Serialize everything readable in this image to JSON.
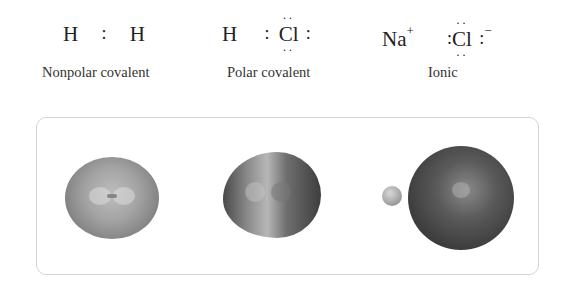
{
  "diagram": {
    "bond_types": [
      {
        "label": "Nonpolar covalent",
        "formula": {
          "left_atom": "H",
          "bond_symbol": ":",
          "right_atom": "H"
        },
        "model": "symmetric-electron-cloud-H2"
      },
      {
        "label": "Polar covalent",
        "formula": {
          "left_atom": "H",
          "bond_symbol": ":",
          "right_atom": "Cl",
          "right_lone_pair_symbol": ":"
        },
        "model": "asymmetric-electron-cloud-HCl"
      },
      {
        "label": "Ionic",
        "formula": {
          "cation": "Na",
          "cation_charge": "+",
          "anion": "Cl",
          "anion_charge": "−",
          "anion_pair_symbol": ":"
        },
        "model": "separated-ions-NaCl"
      }
    ],
    "lone_pair_dots": "··",
    "colors": {
      "border": "#d4d4d4",
      "text": "#222222"
    }
  }
}
